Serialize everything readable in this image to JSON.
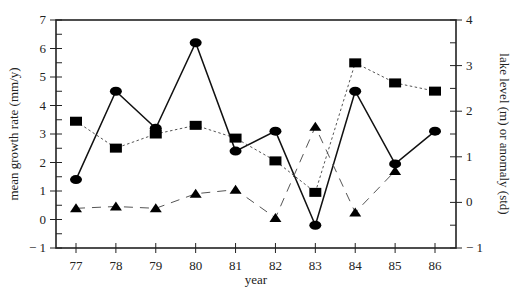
{
  "chart_data": {
    "type": "line",
    "title": "",
    "xlabel": "year",
    "ylabel": "mean growth rate (mm/y)",
    "y2label": "lake level (m) or anomaly (std)",
    "x": [
      "77",
      "78",
      "79",
      "80",
      "81",
      "82",
      "83",
      "84",
      "85",
      "86"
    ],
    "ylim": [
      -1,
      7
    ],
    "y2lim": [
      -1,
      4
    ],
    "yticks": [
      "-1",
      "0",
      "1",
      "2",
      "3",
      "4",
      "5",
      "6",
      "7"
    ],
    "y2ticks": [
      "-1",
      "0",
      "1",
      "2",
      "3",
      "4"
    ],
    "grid": false,
    "legend": "none",
    "series": [
      {
        "name": "mean growth rate",
        "marker": "circle",
        "line": "solid",
        "axis": "left",
        "values": [
          1.4,
          4.5,
          3.2,
          6.2,
          2.4,
          3.1,
          -0.2,
          4.5,
          1.95,
          3.1
        ]
      },
      {
        "name": "lake level",
        "marker": "square",
        "line": "dotted",
        "axis": "right",
        "values": [
          1.78,
          1.19,
          1.5,
          1.69,
          1.41,
          0.91,
          0.22,
          3.06,
          2.62,
          2.44
        ]
      },
      {
        "name": "anomaly",
        "marker": "triangle",
        "line": "dashed",
        "axis": "right",
        "values": [
          -0.13,
          -0.09,
          -0.13,
          0.19,
          0.28,
          -0.34,
          1.66,
          -0.22,
          0.69,
          null
        ]
      }
    ]
  },
  "labels": {
    "xlabel": "year",
    "ylabel": "mean growth rate (mm/y)",
    "y2label": "lake level (m) or anomaly (std)"
  }
}
